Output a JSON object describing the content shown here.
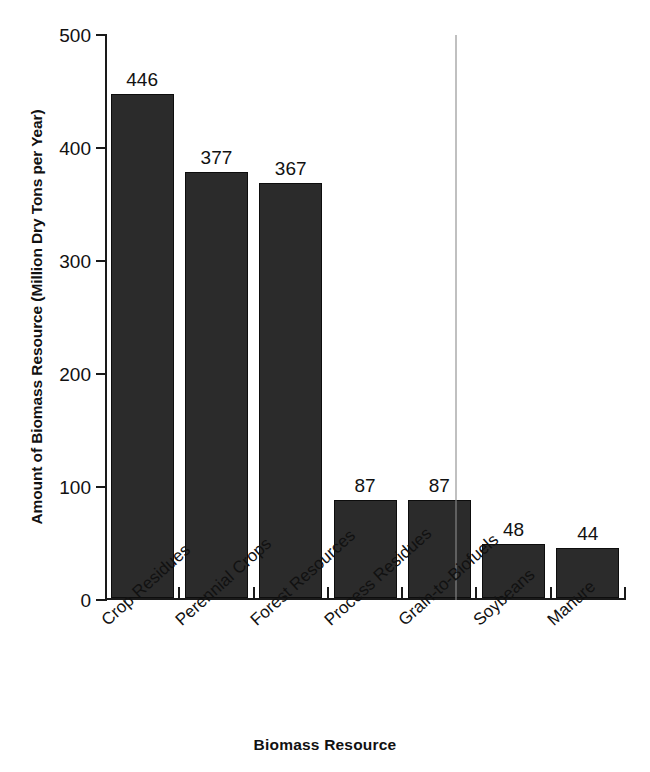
{
  "chart_data": {
    "type": "bar",
    "title": "",
    "xlabel": "Biomass Resource",
    "ylabel": "Amount of Biomass Resource (Million Dry Tons per Year)",
    "categories": [
      "Crop Residues",
      "Perennial Crops",
      "Forest Resources",
      "Process Residues",
      "Grain-to-Biofuels",
      "Soybeans",
      "Manure"
    ],
    "values": [
      446,
      377,
      367,
      87,
      87,
      48,
      44
    ],
    "value_labels": [
      "446",
      "377",
      "367",
      "87",
      "87",
      "48",
      "44"
    ],
    "ylim": [
      0,
      500
    ],
    "ytick_values": [
      0,
      100,
      200,
      300,
      400,
      500
    ],
    "ytick_labels": [
      "0",
      "100",
      "200",
      "300",
      "400",
      "500"
    ],
    "grid": false,
    "legend": false,
    "bar_color": "#2b2b2b",
    "axis_color": "#1a1a1a"
  }
}
